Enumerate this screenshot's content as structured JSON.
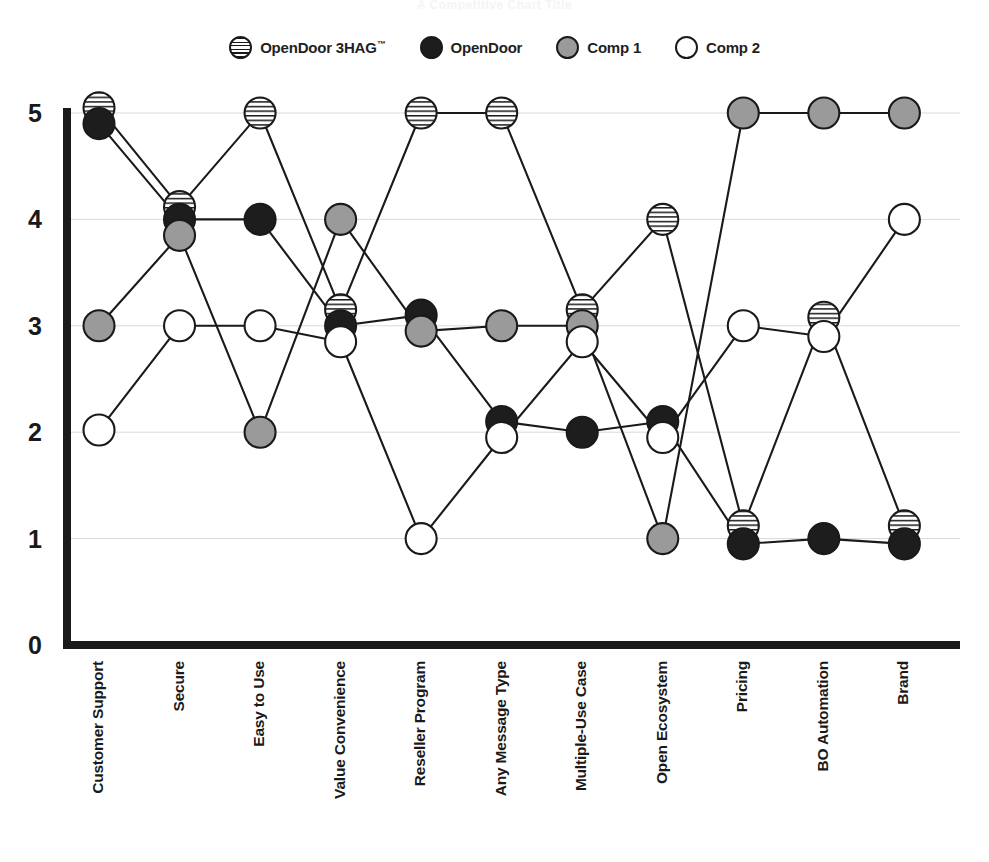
{
  "title": "A Competitive Chart Title",
  "legend": {
    "position": "top-center",
    "items": [
      {
        "label": "OpenDoor 3HAG",
        "trademark": "™",
        "swatch": "striped-circle-icon",
        "color": "#ffffff",
        "key": "opendoor_3hag"
      },
      {
        "label": "OpenDoor",
        "trademark": "",
        "swatch": "filled-black-circle-icon",
        "color": "#1d1d1d",
        "key": "opendoor"
      },
      {
        "label": "Comp 1",
        "trademark": "",
        "swatch": "filled-gray-circle-icon",
        "color": "#9a9a9a",
        "key": "comp1"
      },
      {
        "label": "Comp 2",
        "trademark": "",
        "swatch": "hollow-circle-icon",
        "color": "#ffffff",
        "key": "comp2"
      }
    ]
  },
  "axis": {
    "y_ticks": [
      "5",
      "4",
      "3",
      "2",
      "1",
      "0"
    ],
    "x_tick_rotation": "vertical"
  },
  "chart_data": {
    "type": "line",
    "title": "A Competitive Chart Title",
    "xlabel": "",
    "ylabel": "",
    "ylim": [
      0,
      5
    ],
    "yticks": [
      0,
      1,
      2,
      3,
      4,
      5
    ],
    "grid": true,
    "legend_position": "top-center",
    "categories": [
      "Customer Support",
      "Secure",
      "Easy to Use",
      "Value Convenience",
      "Reseller Program",
      "Any Message Type",
      "Multiple-Use Case",
      "Open Ecosystem",
      "Pricing",
      "BO Automation",
      "Brand"
    ],
    "series": [
      {
        "name": "OpenDoor 3HAG™",
        "marker": "striped-circle",
        "color": "#ffffff",
        "values": [
          5.05,
          4.12,
          5.0,
          3.15,
          5.0,
          5.0,
          3.15,
          4.0,
          1.12,
          3.08,
          1.12
        ]
      },
      {
        "name": "OpenDoor",
        "marker": "filled-black-circle",
        "color": "#1d1d1d",
        "values": [
          4.9,
          4.0,
          4.0,
          3.0,
          3.1,
          2.1,
          2.0,
          2.1,
          0.95,
          1.0,
          0.95
        ]
      },
      {
        "name": "Comp 1",
        "marker": "filled-gray-circle",
        "color": "#9a9a9a",
        "values": [
          3.0,
          3.85,
          2.0,
          4.0,
          2.95,
          3.0,
          3.0,
          1.0,
          5.0,
          5.0,
          5.0
        ]
      },
      {
        "name": "Comp 2",
        "marker": "hollow-circle",
        "color": "#ffffff",
        "values": [
          2.02,
          3.0,
          3.0,
          2.85,
          1.0,
          1.95,
          2.85,
          1.95,
          3.0,
          2.9,
          4.0
        ]
      }
    ]
  }
}
